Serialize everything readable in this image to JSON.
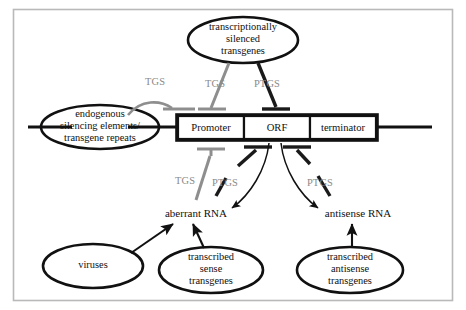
{
  "diagram": {
    "colors": {
      "frame": "#b9b9b9",
      "outline": "#111111",
      "tgs_gray": "#8e8e8e",
      "ptgs_black": "#1a1a1a",
      "label_gray": "#8a8a8a",
      "background": "#ffffff"
    },
    "nodes": {
      "silenced_transgenes": {
        "lines": [
          "transcriptionally",
          "silenced",
          "transgenes"
        ],
        "shape": "ellipse"
      },
      "endogenous_elements": {
        "lines": [
          "endogenous",
          "silencing elements/",
          "transgene repeats"
        ],
        "shape": "ellipse"
      },
      "viruses": {
        "lines": [
          "viruses"
        ],
        "shape": "ellipse"
      },
      "sense_transgenes": {
        "lines": [
          "transcribed",
          "sense",
          "transgenes"
        ],
        "shape": "ellipse"
      },
      "antisense_transgenes": {
        "lines": [
          "transcribed",
          "antisense",
          "transgenes"
        ],
        "shape": "ellipse"
      }
    },
    "gene_cassette": {
      "segments": [
        {
          "id": "promoter",
          "label": "Promoter"
        },
        {
          "id": "orf",
          "label": "ORF"
        },
        {
          "id": "terminator",
          "label": "terminator"
        }
      ]
    },
    "rna_species": {
      "aberrant": "aberrant RNA",
      "antisense": "antisense RNA"
    },
    "process_labels": {
      "tgs_endogenous": "TGS",
      "tgs_silenced": "TGS",
      "ptgs_silenced": "PTGS",
      "tgs_aberrant": "TGS",
      "ptgs_aberrant": "PTGS",
      "ptgs_antisense": "PTGS"
    },
    "edges": [
      {
        "id": "edge-tgs-endogenous-promoter",
        "from": "endogenous_elements",
        "to": "promoter",
        "type": "inhibition",
        "label": "TGS",
        "color": "gray"
      },
      {
        "id": "edge-tgs-silenced-promoter",
        "from": "silenced_transgenes",
        "to": "promoter",
        "type": "inhibition",
        "label": "TGS",
        "color": "gray"
      },
      {
        "id": "edge-ptgs-silenced-orf",
        "from": "silenced_transgenes",
        "to": "orf",
        "type": "inhibition",
        "label": "PTGS",
        "color": "black"
      },
      {
        "id": "edge-tgs-aberrant-promoter",
        "from": "aberrant_rna",
        "to": "promoter",
        "type": "inhibition",
        "label": "TGS",
        "color": "gray"
      },
      {
        "id": "edge-ptgs-aberrant-orf",
        "from": "aberrant_rna",
        "to": "orf",
        "type": "inhibition",
        "label": "PTGS",
        "color": "black"
      },
      {
        "id": "edge-ptgs-antisense-orf",
        "from": "antisense_rna",
        "to": "orf",
        "type": "inhibition",
        "label": "PTGS",
        "color": "black"
      },
      {
        "id": "edge-orf-aberrant",
        "from": "orf",
        "to": "aberrant_rna",
        "type": "arrow",
        "label": "",
        "color": "black"
      },
      {
        "id": "edge-orf-antisense",
        "from": "orf",
        "to": "antisense_rna",
        "type": "arrow",
        "label": "",
        "color": "black"
      },
      {
        "id": "edge-viruses-aberrant",
        "from": "viruses",
        "to": "aberrant_rna",
        "type": "arrow",
        "label": "",
        "color": "black"
      },
      {
        "id": "edge-sense-aberrant",
        "from": "sense_transgenes",
        "to": "aberrant_rna",
        "type": "arrow",
        "label": "",
        "color": "black"
      },
      {
        "id": "edge-antisense-antisense-rna",
        "from": "antisense_transgenes",
        "to": "antisense_rna",
        "type": "arrow",
        "label": "",
        "color": "black"
      }
    ]
  }
}
